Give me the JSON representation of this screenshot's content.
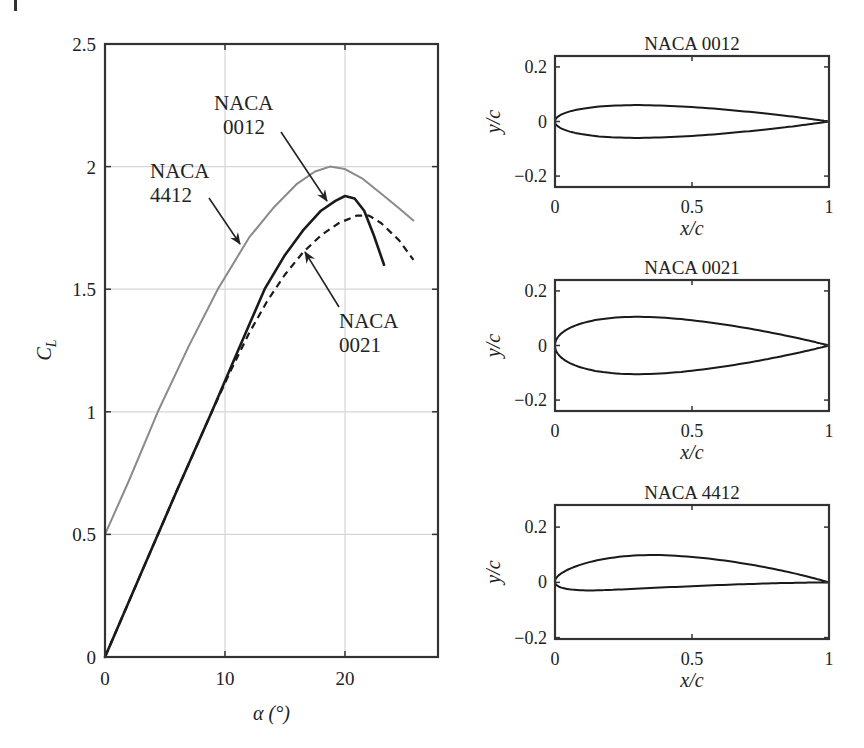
{
  "chart_data": [
    {
      "type": "line",
      "title": "",
      "xlabel": "α (°)",
      "ylabel": "C_L",
      "ylabel_main": "C",
      "ylabel_sub": "L",
      "xlim": [
        0,
        27.75
      ],
      "ylim": [
        0,
        2.5
      ],
      "xticks": [
        0,
        10,
        20
      ],
      "xtick_labels": [
        "0",
        "10",
        "20"
      ],
      "yticks": [
        0,
        0.5,
        1,
        1.5,
        2,
        2.5
      ],
      "ytick_labels": [
        "0",
        "0.5",
        "1",
        "1.5",
        "2",
        "2.5"
      ],
      "grid": true,
      "legend": null,
      "series": [
        {
          "name": "NACA 4412",
          "style": "solid",
          "color": "#8a8a8a",
          "width": 2,
          "x": [
            0,
            2,
            4.4,
            7,
            9.4,
            12,
            14,
            16,
            17.5,
            18.75,
            20,
            21.5,
            23,
            24.5,
            25.7
          ],
          "y": [
            0.5,
            0.72,
            1.0,
            1.27,
            1.5,
            1.71,
            1.83,
            1.93,
            1.98,
            2.0,
            1.99,
            1.95,
            1.89,
            1.83,
            1.78
          ]
        },
        {
          "name": "NACA 0012",
          "style": "solid",
          "color": "#1a1a1a",
          "width": 2.6,
          "x": [
            0,
            3,
            6,
            8.9,
            11,
            13.3,
            15,
            16.5,
            18,
            19.2,
            20,
            20.8,
            21.6,
            22.4,
            23.25
          ],
          "y": [
            0,
            0.34,
            0.68,
            1.0,
            1.24,
            1.5,
            1.64,
            1.74,
            1.82,
            1.86,
            1.88,
            1.87,
            1.82,
            1.72,
            1.6
          ]
        },
        {
          "name": "NACA 0021",
          "style": "dashed",
          "color": "#1a1a1a",
          "width": 2.2,
          "x": [
            0,
            3,
            6,
            8.9,
            10.5,
            12,
            13.5,
            15,
            16.5,
            18,
            19.5,
            21,
            22,
            23,
            24.5,
            25.7
          ],
          "y": [
            0,
            0.34,
            0.68,
            1.0,
            1.17,
            1.32,
            1.45,
            1.56,
            1.65,
            1.72,
            1.77,
            1.8,
            1.8,
            1.77,
            1.7,
            1.62
          ]
        }
      ],
      "annotations": [
        {
          "text_line1": "NACA",
          "text_line2": "0012",
          "target": "NACA 0012",
          "label_xy": [
            214,
            110
          ],
          "arrow_from": [
            281,
            132
          ],
          "arrow_to": [
            327,
            201
          ]
        },
        {
          "text_line1": "NACA",
          "text_line2": "4412",
          "target": "NACA 4412",
          "label_xy": [
            150,
            178
          ],
          "arrow_from": [
            209,
            198
          ],
          "arrow_to": [
            240,
            244
          ]
        },
        {
          "text_line1": "NACA",
          "text_line2": "0021",
          "target": "NACA 0021",
          "label_xy": [
            339,
            328
          ],
          "arrow_from": [
            339,
            307
          ],
          "arrow_to": [
            305,
            252
          ]
        }
      ]
    },
    {
      "type": "line",
      "title": "NACA 0012",
      "xlabel": "x/c",
      "ylabel": "y/c",
      "xlim": [
        0,
        1
      ],
      "ylim": [
        -0.24,
        0.24
      ],
      "xticks": [
        0,
        0.5,
        1
      ],
      "xtick_labels": [
        "0",
        "0.5",
        "1"
      ],
      "yticks": [
        -0.2,
        0,
        0.2
      ],
      "ytick_labels": [
        "−0.2",
        "0",
        "0.2"
      ],
      "grid": false,
      "series": [
        {
          "name": "NACA 0012 profile",
          "thickness": 0.12,
          "camber": 0,
          "camber_pos": 0
        }
      ]
    },
    {
      "type": "line",
      "title": "NACA 0021",
      "xlabel": "x/c",
      "ylabel": "y/c",
      "xlim": [
        0,
        1
      ],
      "ylim": [
        -0.24,
        0.24
      ],
      "xticks": [
        0,
        0.5,
        1
      ],
      "xtick_labels": [
        "0",
        "0.5",
        "1"
      ],
      "yticks": [
        -0.2,
        0,
        0.2
      ],
      "ytick_labels": [
        "−0.2",
        "0",
        "0.2"
      ],
      "grid": false,
      "series": [
        {
          "name": "NACA 0021 profile",
          "thickness": 0.21,
          "camber": 0,
          "camber_pos": 0
        }
      ]
    },
    {
      "type": "line",
      "title": "NACA 4412",
      "xlabel": "x/c",
      "ylabel": "y/c",
      "xlim": [
        0,
        1
      ],
      "ylim": [
        -0.205,
        0.28
      ],
      "xticks": [
        0,
        0.5,
        1
      ],
      "xtick_labels": [
        "0",
        "0.5",
        "1"
      ],
      "yticks": [
        -0.2,
        0,
        0.2
      ],
      "ytick_labels": [
        "−0.2",
        "0",
        "0.2"
      ],
      "grid": false,
      "series": [
        {
          "name": "NACA 4412 profile",
          "thickness": 0.12,
          "camber": 0.04,
          "camber_pos": 0.4
        }
      ]
    }
  ],
  "layout": {
    "main": {
      "left": 105,
      "right": 438,
      "top": 44,
      "bottom": 657
    },
    "subplots": [
      {
        "left": 555,
        "right": 829,
        "top": 56,
        "bottom": 187
      },
      {
        "left": 555,
        "right": 829,
        "top": 280,
        "bottom": 411
      },
      {
        "left": 555,
        "right": 829,
        "top": 505,
        "bottom": 639
      }
    ],
    "grid_color": "#d6d6d6",
    "axis_color": "#333333"
  }
}
